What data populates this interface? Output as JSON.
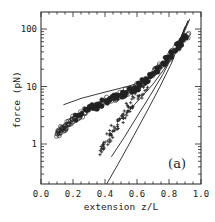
{
  "chart_data": {
    "type": "scatter",
    "title": "",
    "panel_label": "(a)",
    "xlabel": "extension  z/L",
    "ylabel": "force  (pN)",
    "xlim": [
      0.0,
      1.0
    ],
    "ylim": [
      0.2,
      200
    ],
    "yscale": "log",
    "grid": false,
    "legend": null,
    "x_ticks": [
      "0.0",
      "0.2",
      "0.4",
      "0.6",
      "0.8",
      "1.0"
    ],
    "y_ticks": [
      "1",
      "10",
      "100"
    ],
    "series": [
      {
        "name": "data (circles)",
        "marker": "circle",
        "x": [
          0.1,
          0.13,
          0.16,
          0.2,
          0.25,
          0.3,
          0.35,
          0.4,
          0.45,
          0.5,
          0.55,
          0.6,
          0.65,
          0.7,
          0.75,
          0.8,
          0.85,
          0.88,
          0.92
        ],
        "y": [
          1.5,
          1.8,
          2.1,
          2.6,
          3.3,
          4.0,
          4.7,
          5.5,
          6.3,
          7.2,
          8.3,
          9.8,
          12.5,
          17,
          24,
          33,
          48,
          60,
          80
        ]
      },
      {
        "name": "data (crosses)",
        "marker": "cross",
        "x": [
          0.37,
          0.4,
          0.43,
          0.46,
          0.5,
          0.53,
          0.56,
          0.6,
          0.64,
          0.68
        ],
        "y": [
          0.75,
          1.0,
          1.4,
          1.9,
          2.7,
          3.6,
          4.8,
          6.5,
          9.0,
          13
        ]
      },
      {
        "name": "fit curve 1 (upper)",
        "marker": "line",
        "x": [
          0.14,
          0.25,
          0.4,
          0.55,
          0.65,
          0.72,
          0.8,
          0.87,
          0.93
        ],
        "y": [
          4.8,
          6.2,
          8.0,
          10.2,
          12.5,
          16,
          28,
          60,
          150
        ]
      },
      {
        "name": "fit curve 2",
        "marker": "line",
        "x": [
          0.48,
          0.55,
          0.62,
          0.7,
          0.78,
          0.85,
          0.92
        ],
        "y": [
          2.4,
          3.8,
          6.2,
          11,
          22,
          50,
          140
        ]
      },
      {
        "name": "fit curve 3",
        "marker": "line",
        "x": [
          0.44,
          0.52,
          0.6,
          0.68,
          0.76,
          0.84,
          0.92
        ],
        "y": [
          0.6,
          1.3,
          3.0,
          6.8,
          16,
          42,
          140
        ]
      },
      {
        "name": "fit curve 4 (lower)",
        "marker": "line",
        "x": [
          0.41,
          0.5,
          0.58,
          0.66,
          0.74,
          0.82,
          0.9
        ],
        "y": [
          0.2,
          0.55,
          1.4,
          3.6,
          9.5,
          27,
          110
        ]
      }
    ]
  },
  "labels": {
    "panel": "(a)",
    "xlabel": "extension  z/L",
    "ylabel": "force  (pN)",
    "x_ticks": [
      "0.0",
      "0.2",
      "0.4",
      "0.6",
      "0.8",
      "1.0"
    ],
    "y_ticks": [
      "1",
      "10",
      "100"
    ]
  }
}
